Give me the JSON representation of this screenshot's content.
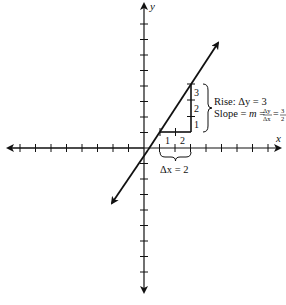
{
  "figure": {
    "axes": {
      "x_label": "x",
      "y_label": "y",
      "tick_spacing_units": 1,
      "x_range": [
        -8,
        8
      ],
      "y_range": [
        -9,
        9
      ]
    },
    "line": {
      "description": "Line with slope 3/2",
      "slope": 1.5,
      "point_a": [
        1,
        1
      ],
      "point_b": [
        3,
        4
      ]
    },
    "triangle": {
      "run_tick_labels": [
        "1",
        "2"
      ],
      "rise_tick_labels": [
        "1",
        "2",
        "3"
      ]
    },
    "annotations": {
      "rise_text": "Rise: Δy = 3",
      "slope_prefix": "Slope = ",
      "slope_m": "m",
      "slope_eq": " = ",
      "frac_dy": "Δy",
      "frac_dx": "Δx",
      "frac_eq": " = ",
      "frac_num": "3",
      "frac_den": "2",
      "run_text": "Δx = 2"
    },
    "colors": {
      "ink": "#111111",
      "background": "#ffffff"
    }
  }
}
